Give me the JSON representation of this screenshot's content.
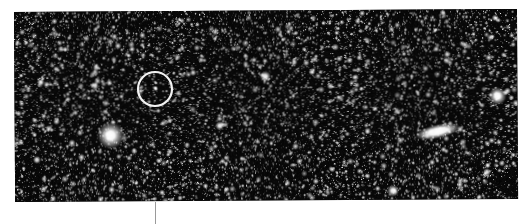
{
  "figure": {
    "kind": "astronomical-photographic-plate",
    "width": 530,
    "height": 224,
    "background_color": "#ffffff",
    "caption": ""
  },
  "plate": {
    "left": 14,
    "top": 12,
    "width": 503,
    "height": 190,
    "rotation_deg": -0.35,
    "sky_color": "#050505",
    "star_color": "#ffffff",
    "description": "Dense field of faint stars on a black sky background"
  },
  "annotation": {
    "circle": {
      "label": "target-object-circle",
      "center_x": 155,
      "center_y": 89,
      "radius": 17,
      "stroke_color": "#f2f2f2",
      "stroke_width": 2.2
    },
    "pointer_line": {
      "label": "leader-line",
      "x": 155,
      "y_top": 202,
      "y_bottom": 224,
      "color": "#9a9a9a",
      "width": 1
    }
  },
  "objects": [
    {
      "name": "circled-target",
      "type": "point-source",
      "x": 155,
      "y": 89,
      "size": 5,
      "brightness": 0.95,
      "annotated": true
    },
    {
      "name": "bright-saturated-star",
      "type": "saturated-star",
      "x": 110,
      "y": 136,
      "size": 27,
      "brightness": 1.0,
      "annotated": false
    },
    {
      "name": "edge-on-galaxy",
      "type": "elongated-nebulosity",
      "x": 437,
      "y": 134,
      "size_major": 46,
      "size_minor": 14,
      "angle_deg": -12,
      "brightness": 1.0,
      "annotated": false
    },
    {
      "name": "right-edge-blob",
      "type": "bright-star",
      "x": 497,
      "y": 99,
      "size": 18,
      "brightness": 1.0,
      "annotated": false
    },
    {
      "name": "mid-upper-star",
      "type": "bright-star",
      "x": 265,
      "y": 78,
      "size": 11,
      "brightness": 0.92,
      "annotated": false
    },
    {
      "name": "lower-mid-star",
      "type": "bright-star",
      "x": 219,
      "y": 127,
      "size": 9,
      "brightness": 0.9,
      "annotated": false
    },
    {
      "name": "bottom-mid-star",
      "type": "bright-star",
      "x": 392,
      "y": 193,
      "size": 12,
      "brightness": 0.95,
      "annotated": false
    },
    {
      "name": "left-edge-star",
      "type": "bright-star",
      "x": 36,
      "y": 160,
      "size": 8,
      "brightness": 0.85,
      "annotated": false
    },
    {
      "name": "upper-right-star",
      "type": "bright-star",
      "x": 447,
      "y": 57,
      "size": 7,
      "brightness": 0.8,
      "annotated": false
    },
    {
      "name": "right-mid-star",
      "type": "bright-star",
      "x": 486,
      "y": 175,
      "size": 8,
      "brightness": 0.85,
      "annotated": false
    },
    {
      "name": "upper-left-clump",
      "type": "bright-star",
      "x": 96,
      "y": 68,
      "size": 7,
      "brightness": 0.8,
      "annotated": false
    },
    {
      "name": "center-faint-clump",
      "type": "bright-star",
      "x": 330,
      "y": 88,
      "size": 7,
      "brightness": 0.78,
      "annotated": false
    }
  ],
  "starfield": {
    "seed": 20240517,
    "faint_star_count": 5200,
    "medium_star_count": 680,
    "noise_density": 0.33,
    "note": "Grainy emulsion texture with dense faint point sources"
  }
}
